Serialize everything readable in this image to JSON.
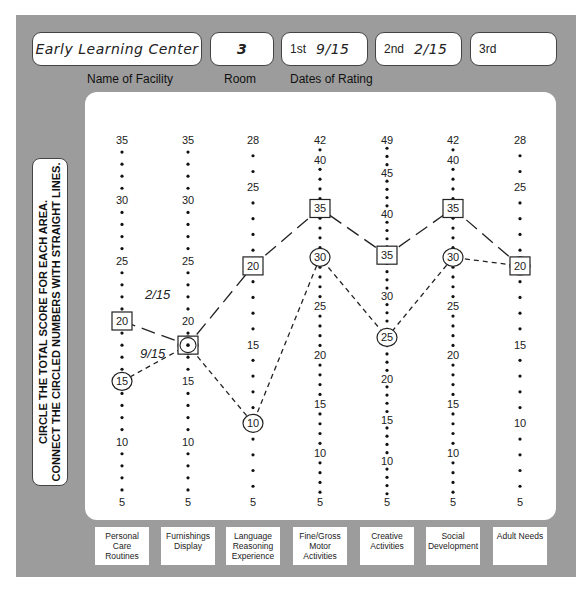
{
  "header": {
    "facility": {
      "value": "Early Learning Center",
      "caption": "Name of Facility"
    },
    "room": {
      "value": "3",
      "caption": "Room"
    },
    "dates": {
      "caption": "Dates of Rating",
      "first": {
        "label": "1st",
        "value": "9/15"
      },
      "second": {
        "label": "2nd",
        "value": "2/15"
      },
      "third": {
        "label": "3rd",
        "value": ""
      }
    }
  },
  "instructions": {
    "line1": "CIRCLE THE TOTAL SCORE FOR EACH AREA.",
    "line2": "CONNECT THE CIRCLED NUMBERS WITH STRAIGHT LINES."
  },
  "tabs": [
    {
      "label": "Personal Care Routines"
    },
    {
      "label": "Furnishings Display"
    },
    {
      "label": "Language Reasoning Experience"
    },
    {
      "label": "Fine/Gross Motor Activities"
    },
    {
      "label": "Creative Activities"
    },
    {
      "label": "Social Development"
    },
    {
      "label": "Adult Needs"
    }
  ],
  "annotations": {
    "first_line_label": "9/15",
    "second_line_label": "2/15"
  },
  "colors": {
    "panel": "#9c9c9c",
    "card": "#ffffff",
    "ink": "#222222"
  },
  "chart_data": {
    "type": "line",
    "categories": [
      "Personal Care Routines",
      "Furnishings Display",
      "Language Reasoning Experience",
      "Fine/Gross Motor Activities",
      "Creative Activities",
      "Social Development",
      "Adult Needs"
    ],
    "axis_max": [
      35,
      35,
      28,
      42,
      49,
      42,
      28
    ],
    "axis_min": 5,
    "tick_labels": [
      [
        35,
        30,
        25,
        20,
        15,
        10,
        5
      ],
      [
        35,
        30,
        25,
        20,
        15,
        10,
        5
      ],
      [
        28,
        25,
        20,
        15,
        10,
        5
      ],
      [
        42,
        40,
        35,
        30,
        25,
        20,
        15,
        10,
        5
      ],
      [
        49,
        45,
        40,
        35,
        30,
        25,
        20,
        15,
        10,
        5
      ],
      [
        42,
        40,
        35,
        30,
        25,
        20,
        15,
        10,
        5
      ],
      [
        28,
        25,
        20,
        15,
        10,
        5
      ]
    ],
    "series": [
      {
        "name": "1st rating 9/15",
        "marker": "circle",
        "line": "short-dash",
        "values": [
          15,
          18,
          10,
          30,
          25,
          30,
          20
        ]
      },
      {
        "name": "2nd rating 2/15",
        "marker": "square",
        "line": "long-dash",
        "values": [
          20,
          18,
          20,
          35,
          35,
          35,
          20
        ]
      }
    ],
    "grid": false,
    "legend": "handwritten labels on lines"
  }
}
